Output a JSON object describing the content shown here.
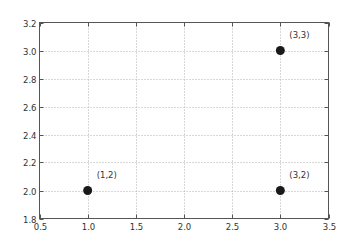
{
  "chart_data": {
    "type": "scatter",
    "title": "",
    "xlabel": "",
    "ylabel": "",
    "xlim": [
      0.5,
      3.5
    ],
    "ylim": [
      1.8,
      3.2
    ],
    "xticks": [
      0.5,
      1.0,
      1.5,
      2.0,
      2.5,
      3.0,
      3.5
    ],
    "xtick_labels": [
      "0.5",
      "1.0",
      "1.5",
      "2.0",
      "2.5",
      "3.0",
      "3.5"
    ],
    "yticks": [
      1.8,
      2.0,
      2.2,
      2.4,
      2.6,
      2.8,
      3.0,
      3.2
    ],
    "ytick_labels": [
      "1.8",
      "2.0",
      "2.2",
      "2.4",
      "2.6",
      "2.8",
      "3.0",
      "3.2"
    ],
    "grid": true,
    "legend": null,
    "series": [
      {
        "name": "points",
        "marker": "circle",
        "color": "#1a1a1a",
        "points": [
          {
            "x": 1,
            "y": 2,
            "label": "(1,2)"
          },
          {
            "x": 3,
            "y": 3,
            "label": "(3,3)"
          },
          {
            "x": 3,
            "y": 2,
            "label": "(3,2)"
          }
        ]
      }
    ],
    "colors": {
      "axis": "#555555",
      "grid": "#b0b0b0",
      "marker": "#1a1a1a",
      "text": "#333333"
    }
  }
}
